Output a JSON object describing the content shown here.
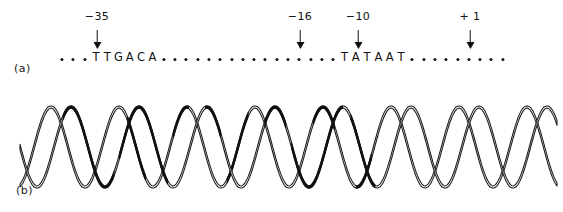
{
  "figure": {
    "width": 563,
    "height": 212,
    "background": "#ffffff",
    "ink_color": "#111111"
  },
  "panel_a": {
    "label": "(a)",
    "description": "Linear promoter DNA sequence map with consensus elements and numbered positions",
    "sequence_line": {
      "start_x": 62,
      "end_x": 491,
      "baseline_y": 58,
      "dot_spacing": 11.3,
      "dot_color": "#151515",
      "elements": [
        {
          "type": "dots",
          "count": 3
        },
        {
          "type": "letters",
          "text": "TTGACA"
        },
        {
          "type": "dots",
          "count": 16
        },
        {
          "type": "letters",
          "text": "TATAAT"
        },
        {
          "type": "dots",
          "count": 9
        }
      ]
    },
    "position_markers": [
      {
        "name": "minus-35",
        "label": "−35",
        "x": 97,
        "label_y": 10,
        "arrow_top": 30,
        "arrow_height": 18
      },
      {
        "name": "minus-16",
        "label": "−16",
        "x": 300,
        "label_y": 10,
        "arrow_top": 30,
        "arrow_height": 18
      },
      {
        "name": "minus-10",
        "label": "−10",
        "x": 358,
        "label_y": 10,
        "arrow_top": 30,
        "arrow_height": 18
      },
      {
        "name": "plus-1",
        "label": "+ 1",
        "x": 470,
        "label_y": 10,
        "arrow_top": 30,
        "arrow_height": 18
      }
    ]
  },
  "panel_b": {
    "label": "(b)",
    "description": "Double-helical DNA ribbon drawing with darkened (filled) segments marking protein contact regions",
    "helix": {
      "left": 20,
      "right": 558,
      "center_y": 57,
      "amplitude": 40,
      "period": 68,
      "strand_offset": 20,
      "ribbon_width": 5.5,
      "stroke_color": "#1a1a1a",
      "fill_color": "#ffffff",
      "dark_color": "#111111",
      "turns": 8,
      "dark_segments": [
        {
          "strand": "front",
          "start_frac": 0.08,
          "end_frac": 0.175
        },
        {
          "strand": "front",
          "start_frac": 0.185,
          "end_frac": 0.275
        },
        {
          "strand": "back",
          "start_frac": 0.2,
          "end_frac": 0.235
        },
        {
          "strand": "back",
          "start_frac": 0.285,
          "end_frac": 0.315
        },
        {
          "strand": "front",
          "start_frac": 0.345,
          "end_frac": 0.375
        },
        {
          "strand": "back",
          "start_frac": 0.385,
          "end_frac": 0.425
        },
        {
          "strand": "front",
          "start_frac": 0.455,
          "end_frac": 0.495
        },
        {
          "strand": "front",
          "start_frac": 0.505,
          "end_frac": 0.6
        },
        {
          "strand": "back",
          "start_frac": 0.545,
          "end_frac": 0.585
        },
        {
          "strand": "front",
          "start_frac": 0.615,
          "end_frac": 0.66
        },
        {
          "strand": "back",
          "start_frac": 0.625,
          "end_frac": 0.655
        }
      ]
    }
  }
}
